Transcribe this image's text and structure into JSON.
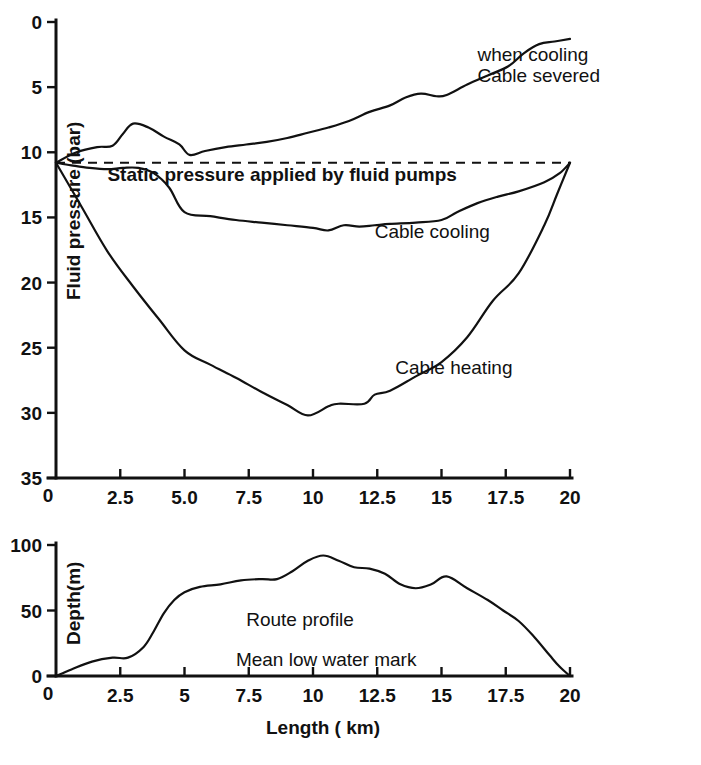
{
  "figure": {
    "background_color": "#ffffff",
    "ink_color": "#111111"
  },
  "chart_data": [
    {
      "type": "line",
      "id": "fluid-pressure-profile",
      "title": "",
      "xlabel": "",
      "ylabel": "Fluid pressure (bar)",
      "xlim": [
        0,
        20
      ],
      "ylim": [
        0,
        35
      ],
      "grid": false,
      "legend_position": "inline-annotations",
      "xticks": [
        "0",
        "2.5",
        "5.0",
        "7.5",
        "10",
        "12.5",
        "15",
        "17.5",
        "20"
      ],
      "xtick_values": [
        0,
        2.5,
        5,
        7.5,
        10,
        12.5,
        15,
        17.5,
        20
      ],
      "yticks": [
        "0",
        "5",
        "10",
        "15",
        "20",
        "25",
        "30",
        "35"
      ],
      "ytick_values": [
        0,
        5,
        10,
        15,
        20,
        25,
        30,
        35
      ],
      "series": [
        {
          "name": "Cable heating",
          "style": "solid",
          "x": [
            0,
            1.0,
            2.0,
            3.0,
            4.0,
            5.0,
            6.0,
            7.0,
            8.0,
            9.0,
            9.8,
            10.6,
            11.0,
            12.0,
            12.4,
            13.0,
            14.0,
            15.0,
            16.0,
            17.0,
            18.0,
            19.0,
            19.5,
            20
          ],
          "y": [
            10.8,
            14.2,
            17.6,
            20.3,
            22.8,
            25.2,
            26.3,
            27.3,
            28.4,
            29.4,
            30.2,
            29.5,
            29.3,
            29.3,
            28.6,
            28.3,
            27.2,
            26.1,
            24.2,
            21.4,
            19.3,
            15.6,
            13.2,
            10.8
          ]
        },
        {
          "name": "Cable cooling",
          "style": "solid",
          "x": [
            0,
            0.6,
            1.3,
            2.0,
            2.6,
            3.2,
            3.8,
            4.4,
            5.0,
            6.0,
            7.0,
            8.0,
            9.0,
            10.0,
            10.6,
            11.2,
            11.8,
            12.4,
            13.0,
            14.0,
            15.0,
            15.6,
            16.4,
            17.2,
            18.0,
            19.0,
            19.6,
            20
          ],
          "y": [
            10.8,
            11.0,
            11.2,
            11.3,
            11.2,
            11.2,
            11.6,
            12.7,
            14.6,
            14.9,
            15.2,
            15.4,
            15.6,
            15.8,
            16.0,
            15.6,
            15.7,
            15.6,
            15.5,
            15.4,
            15.2,
            14.6,
            13.9,
            13.4,
            13.0,
            12.3,
            11.6,
            10.8
          ]
        },
        {
          "name": "Static pressure applied by fluid pumps",
          "style": "dashed",
          "x": [
            0,
            20
          ],
          "y": [
            10.8,
            10.8
          ]
        },
        {
          "name": "Cable severed when cooling",
          "style": "solid",
          "x": [
            0,
            0.8,
            1.6,
            2.2,
            2.6,
            3.0,
            3.6,
            4.2,
            4.8,
            5.2,
            5.8,
            6.6,
            7.4,
            8.2,
            9.0,
            9.8,
            10.6,
            11.4,
            12.2,
            13.0,
            13.6,
            14.2,
            14.8,
            15.2,
            16.0,
            16.8,
            17.6,
            18.2,
            18.8,
            19.4,
            20
          ],
          "y": [
            10.8,
            10.0,
            9.6,
            9.5,
            8.6,
            7.8,
            8.1,
            8.8,
            9.4,
            10.2,
            9.9,
            9.6,
            9.4,
            9.2,
            8.9,
            8.5,
            8.1,
            7.6,
            6.9,
            6.4,
            5.8,
            5.5,
            5.7,
            5.6,
            4.8,
            4.1,
            3.4,
            2.4,
            1.7,
            1.5,
            1.3
          ]
        }
      ],
      "annotations": [
        {
          "text": "Cable heating",
          "x": 13.2,
          "y": 27.0
        },
        {
          "text": "Cable cooling",
          "x": 12.4,
          "y": 16.6
        },
        {
          "text": "Static pressure applied by fluid pumps",
          "x": 2.0,
          "y": 12.2,
          "bold": true
        },
        {
          "text": "Cable severed",
          "x": 16.4,
          "y": 4.6
        },
        {
          "text": "when cooling",
          "x": 16.4,
          "y": 3.0
        }
      ]
    },
    {
      "type": "line",
      "id": "route-depth-profile",
      "title": "",
      "xlabel": "Length ( km)",
      "ylabel": "Depth(m)",
      "xlim": [
        0,
        20
      ],
      "ylim": [
        100,
        0
      ],
      "y_axis_inverted": true,
      "grid": false,
      "legend_position": "inline-annotations",
      "xticks": [
        "0",
        "2.5",
        "5",
        "7.5",
        "10",
        "12.5",
        "15",
        "17.5",
        "20"
      ],
      "xtick_values": [
        0,
        2.5,
        5,
        7.5,
        10,
        12.5,
        15,
        17.5,
        20
      ],
      "yticks": [
        "0",
        "50",
        "100"
      ],
      "ytick_values": [
        0,
        50,
        100
      ],
      "series": [
        {
          "name": "Mean low water mark",
          "style": "dashed",
          "x": [
            0,
            20
          ],
          "y": [
            0,
            0
          ]
        },
        {
          "name": "Route profile",
          "style": "solid",
          "x": [
            0,
            0.6,
            1.4,
            2.2,
            2.8,
            3.4,
            3.8,
            4.2,
            4.6,
            5.0,
            5.6,
            6.4,
            7.2,
            8.0,
            8.6,
            9.2,
            9.8,
            10.4,
            11.0,
            11.6,
            12.2,
            12.8,
            13.4,
            14.0,
            14.6,
            15.2,
            16.0,
            16.8,
            17.4,
            18.0,
            18.6,
            19.2,
            19.6,
            20
          ],
          "y": [
            0,
            5,
            11,
            14,
            14,
            22,
            34,
            48,
            58,
            64,
            68,
            70,
            73,
            74,
            74,
            80,
            88,
            92,
            88,
            83,
            82,
            78,
            70,
            67,
            70,
            76,
            67,
            58,
            50,
            42,
            30,
            16,
            7,
            0
          ]
        }
      ],
      "annotations": [
        {
          "text": "Mean low water mark",
          "x": 7.0,
          "y": 8
        },
        {
          "text": "Route profile",
          "x": 7.4,
          "y": 38
        }
      ]
    }
  ]
}
